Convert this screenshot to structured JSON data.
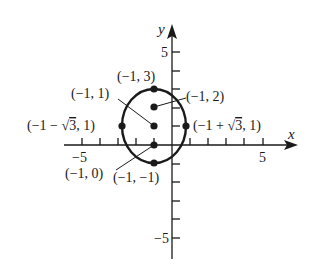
{
  "figure": {
    "type": "coordinate-plot-ellipse",
    "axes": {
      "x_label": "x",
      "y_label": "y",
      "x_tick_labels": {
        "neg": "−5",
        "pos": "5"
      },
      "y_tick_labels": {
        "pos": "5",
        "neg": "−5"
      },
      "x_range": [
        -5,
        6
      ],
      "y_range": [
        -6,
        6
      ]
    },
    "ellipse": {
      "center": [
        -1,
        1
      ],
      "semi_axis_x": 1.732,
      "semi_axis_y": 2,
      "equation_hint": "(x+1)^2/3 + (y-1)^2/4 = 1"
    },
    "points": [
      {
        "id": "top-vertex",
        "coords": [
          -1,
          3
        ],
        "label": "(−1, 3)"
      },
      {
        "id": "focus-upper",
        "coords": [
          -1,
          2
        ],
        "label": "(−1, 2)"
      },
      {
        "id": "center",
        "coords": [
          -1,
          1
        ],
        "label": "(−1, 1)"
      },
      {
        "id": "focus-lower",
        "coords": [
          -1,
          0
        ],
        "label": "(−1, 0)"
      },
      {
        "id": "bottom-vertex",
        "coords": [
          -1,
          -1
        ],
        "label": "(−1, −1)"
      },
      {
        "id": "left-covertex",
        "coords": [
          -2.732,
          1
        ],
        "label_parts": [
          "(−1 − ",
          "3",
          ", 1)"
        ]
      },
      {
        "id": "right-covertex",
        "coords": [
          0.732,
          1
        ],
        "label_parts": [
          "(−1 + ",
          "3",
          ", 1)"
        ]
      }
    ],
    "colors": {
      "ink": "#1a1a1a",
      "background": "#ffffff"
    }
  }
}
